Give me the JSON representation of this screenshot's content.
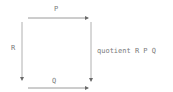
{
  "diagram": {
    "type": "commutative-square",
    "arrows": [
      {
        "id": "top",
        "label": "P",
        "direction": "right"
      },
      {
        "id": "left",
        "label": "R",
        "direction": "down"
      },
      {
        "id": "right",
        "label": "",
        "direction": "down"
      },
      {
        "id": "bottom",
        "label": "Q",
        "direction": "right"
      }
    ],
    "caption": "quotient R P Q",
    "line_color": "#9a9a9a",
    "text_color": "#7a7a7a"
  }
}
